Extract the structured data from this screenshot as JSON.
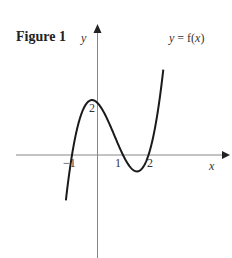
{
  "chart_data": {
    "type": "line",
    "title": "Figure 1",
    "xlabel": "x",
    "ylabel": "y",
    "series": [
      {
        "name": "y = f(x)",
        "function": "f(x) = (x+1)(x-1)(x-2)",
        "x": [
          -1.22,
          -1.0,
          -0.5,
          -0.215,
          0.0,
          0.5,
          1.0,
          1.55,
          2.0,
          2.3,
          2.45
        ],
        "values": [
          -3.96,
          0.0,
          1.88,
          2.11,
          2.0,
          1.13,
          0.0,
          -0.63,
          0.0,
          1.06,
          2.54
        ]
      }
    ],
    "x_ticks_labeled": [
      -1,
      1,
      2
    ],
    "y_ticks_labeled": [
      2
    ],
    "annotations": [
      "2",
      "-1",
      "1",
      "2"
    ],
    "curve_label": "y = f(x)",
    "grid": false,
    "xlim": [
      -3.8,
      4.4
    ],
    "ylim": [
      -4.0,
      5.0
    ]
  },
  "figure": {
    "title": "Figure 1",
    "x_axis_label": "x",
    "y_axis_label": "y",
    "curve_label": "y = f(x)",
    "tick_labels": {
      "x_neg1": "−1",
      "x_1": "1",
      "x_2": "2",
      "y_2": "2"
    },
    "colors": {
      "axis": "#888888",
      "curve": "#1a1a1a",
      "text": "#333333"
    }
  }
}
